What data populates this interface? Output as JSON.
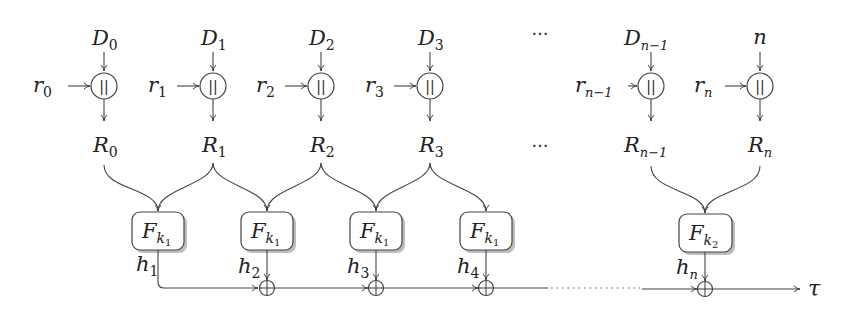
{
  "diagram": {
    "title": "",
    "columns": [
      {
        "data_base": "D",
        "data_sub": "0",
        "rand_base": "r",
        "rand_sub": "0",
        "out_base": "R",
        "out_sub": "0",
        "x": 104
      },
      {
        "data_base": "D",
        "data_sub": "1",
        "rand_base": "r",
        "rand_sub": "1",
        "out_base": "R",
        "out_sub": "1",
        "x": 213
      },
      {
        "data_base": "D",
        "data_sub": "2",
        "rand_base": "r",
        "rand_sub": "2",
        "out_base": "R",
        "out_sub": "2",
        "x": 321
      },
      {
        "data_base": "D",
        "data_sub": "3",
        "rand_base": "r",
        "rand_sub": "3",
        "out_base": "R",
        "out_sub": "3",
        "x": 430
      },
      {
        "data_base": "D",
        "data_sub": "n−1",
        "rand_base": "r",
        "rand_sub": "n−1",
        "out_base": "R",
        "out_sub": "n−1",
        "x": 651
      },
      {
        "data_base": "n",
        "data_sub": "",
        "rand_base": "r",
        "rand_sub": "n",
        "out_base": "R",
        "out_sub": "n",
        "x": 760
      }
    ],
    "concat_symbol": "||",
    "ellipsis": "···",
    "functions": [
      {
        "base": "F",
        "sub": "k",
        "subsub": "1",
        "x": 158,
        "hash_base": "h",
        "hash_sub": "1"
      },
      {
        "base": "F",
        "sub": "k",
        "subsub": "1",
        "x": 267,
        "hash_base": "h",
        "hash_sub": "2"
      },
      {
        "base": "F",
        "sub": "k",
        "subsub": "1",
        "x": 376,
        "hash_base": "h",
        "hash_sub": "3"
      },
      {
        "base": "F",
        "sub": "k",
        "subsub": "1",
        "x": 486,
        "hash_base": "h",
        "hash_sub": "4"
      },
      {
        "base": "F",
        "sub": "k",
        "subsub": "2",
        "x": 705,
        "hash_base": "h",
        "hash_sub": "n"
      }
    ],
    "xor_symbol": "⊕",
    "output_label": "τ",
    "colors": {
      "stroke": "#444444",
      "text": "#222222",
      "shadow": "#bdbdbd",
      "background": "#ffffff"
    }
  }
}
